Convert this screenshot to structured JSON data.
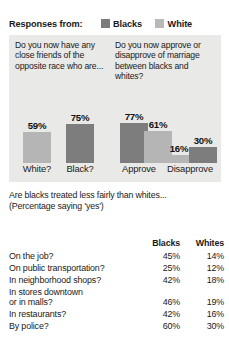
{
  "legend": {
    "title": "Responses from:",
    "entries": [
      {
        "label": "Blacks",
        "color": "#7b7b7b",
        "swatch": "dark"
      },
      {
        "label": "White",
        "color": "#b9b9b9",
        "swatch": "light"
      }
    ]
  },
  "questions": {
    "left": "Do you now have any close friends of the opposite race who are...",
    "right": "Do you now approve or disapprove of marriage between blacks and whites?"
  },
  "axis": {
    "labels": [
      "White?",
      "Black?",
      "Approve",
      "Disapprove"
    ]
  },
  "bars": [
    {
      "value_label": "59%",
      "value": 59,
      "series": "Whites",
      "shade": "light"
    },
    {
      "value_label": "75%",
      "value": 75,
      "series": "Blacks",
      "shade": "dark"
    },
    {
      "value_label": "77%",
      "value": 77,
      "series": "Blacks",
      "shade": "dark"
    },
    {
      "value_label": "61%",
      "value": 61,
      "series": "Whites",
      "shade": "light"
    },
    {
      "value_label": "16%",
      "value": 16,
      "series": "Whites",
      "shade": "light"
    },
    {
      "value_label": "30%",
      "value": 30,
      "series": "Blacks",
      "shade": "dark"
    }
  ],
  "lower": {
    "heading_line1": "Are blacks treated less fairly than whites...",
    "heading_line2": "(Percentage saying 'yes')",
    "columns": [
      "",
      "Blacks",
      "Whites"
    ],
    "rows": [
      {
        "label": "On the job?",
        "blacks": "45%",
        "whites": "14%"
      },
      {
        "label": "On public transportation?",
        "blacks": "25%",
        "whites": "12%"
      },
      {
        "label": "In neighborhood shops?",
        "blacks": "42%",
        "whites": "18%"
      },
      {
        "label": "In stores downtown or in malls?",
        "label_line1": "In stores downtown",
        "label_line2": "or in malls?",
        "blacks": "46%",
        "whites": "19%"
      },
      {
        "label": "In restaurants?",
        "blacks": "42%",
        "whites": "16%"
      },
      {
        "label": "By police?",
        "blacks": "60%",
        "whites": "30%"
      }
    ]
  },
  "chart_data": {
    "type": "bar",
    "categories": [
      "White?",
      "Black?",
      "Approve",
      "Disapprove"
    ],
    "series": [
      {
        "name": "Blacks",
        "values": [
          null,
          75,
          77,
          30
        ]
      },
      {
        "name": "Whites",
        "values": [
          59,
          null,
          61,
          16
        ]
      }
    ],
    "xlabel": "",
    "ylabel": "",
    "ylim": [
      0,
      100
    ],
    "grid": false,
    "legend_position": "top"
  }
}
